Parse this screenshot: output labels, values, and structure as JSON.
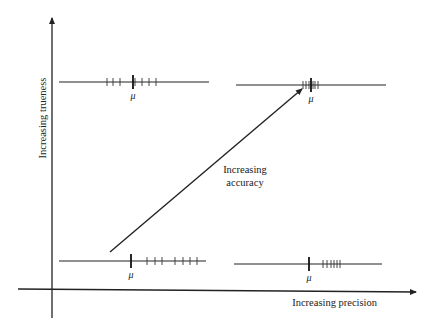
{
  "diagram": {
    "type": "accuracy-precision-trueness-diagram",
    "axes": {
      "y_label": "Increasing trueness",
      "x_label": "Increasing precision"
    },
    "arrow_label_line1": "Increasing",
    "arrow_label_line2": "accuracy",
    "mean_symbol": "μ",
    "panels": [
      {
        "id": "top-left",
        "description": "high trueness, low precision",
        "line": {
          "x1": 59,
          "x2": 209,
          "y": 82
        },
        "mu_x": 133,
        "ticks": [
          107,
          113,
          120,
          135,
          142,
          149,
          156
        ]
      },
      {
        "id": "top-right",
        "description": "high trueness, high precision",
        "line": {
          "x1": 236,
          "x2": 386,
          "y": 85
        },
        "mu_x": 311,
        "ticks": [
          303,
          306,
          309,
          313,
          315,
          318
        ]
      },
      {
        "id": "bottom-left",
        "description": "low trueness, low precision",
        "line": {
          "x1": 59,
          "x2": 206,
          "y": 261
        },
        "mu_x": 131,
        "ticks": [
          147,
          155,
          162,
          175,
          183,
          190,
          197
        ]
      },
      {
        "id": "bottom-right",
        "description": "low trueness, high precision",
        "line": {
          "x1": 234,
          "x2": 382,
          "y": 264
        },
        "mu_x": 309,
        "ticks": [
          323,
          327,
          331,
          334,
          337,
          340
        ]
      }
    ],
    "colors": {
      "ink": "#222222",
      "background": "#ffffff"
    }
  }
}
